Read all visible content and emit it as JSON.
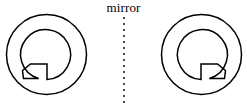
{
  "figure": {
    "type": "chirality-mirror-diagram",
    "background_color": "#ffffff",
    "stroke_color": "#000000",
    "mirror_label": "mirror",
    "mirror_line": {
      "style": "dashed",
      "orientation": "vertical",
      "x": 124,
      "y_start": 17,
      "y_end": 105,
      "dash_length": 2,
      "gap_length": 4,
      "stroke_width": 1.4,
      "color": "#000000"
    },
    "objects": [
      {
        "id": "left-washer",
        "label": "left split-ring washer",
        "handedness": "left-handed",
        "center_x": 46.5,
        "center_y": 54.5,
        "outer_radius": 40.5,
        "inner_radius": 24.5,
        "notch_side": "bottom-left",
        "tab_present": true
      },
      {
        "id": "right-washer",
        "label": "right split-ring washer (mirror image)",
        "handedness": "right-handed",
        "center_x": 201.5,
        "center_y": 54.5,
        "outer_radius": 40.5,
        "inner_radius": 24.5,
        "notch_side": "bottom-right",
        "tab_present": true
      }
    ]
  }
}
